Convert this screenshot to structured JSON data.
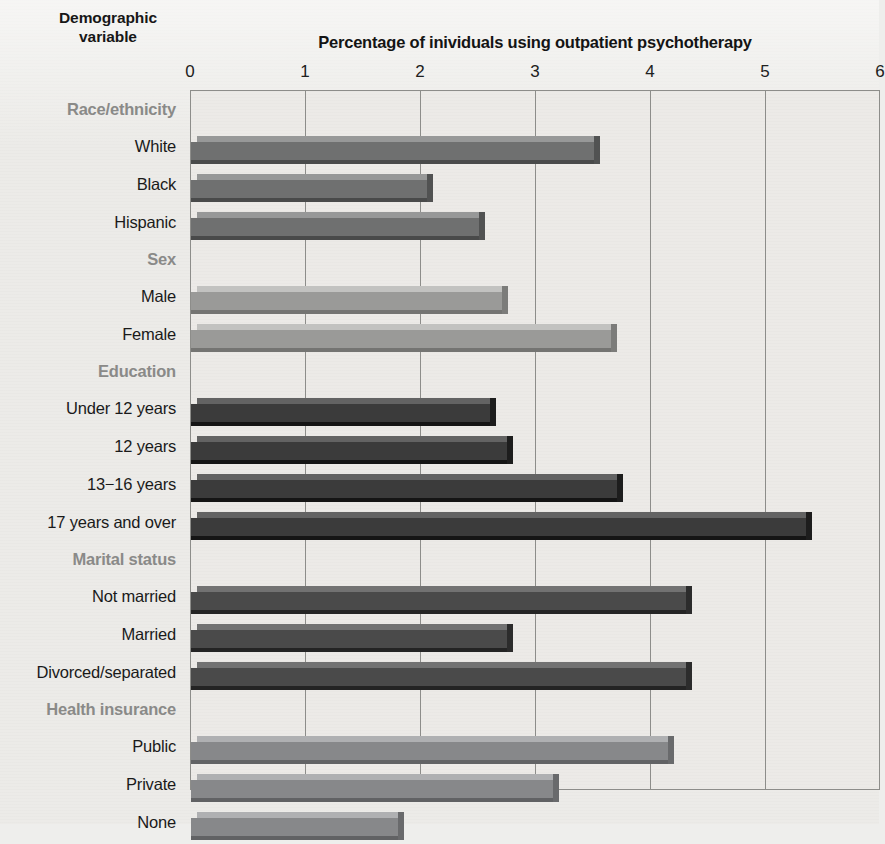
{
  "yaxis_title": {
    "line1": "Demographic",
    "line2": "variable"
  },
  "chart_data": {
    "type": "bar",
    "orientation": "horizontal",
    "title": "Percentage of inividuals using outpatient psychotherapy",
    "xlabel": "Percentage of inividuals using outpatient psychotherapy",
    "ylabel": "Demographic variable",
    "xlim": [
      0,
      6
    ],
    "xticks": [
      0,
      1,
      2,
      3,
      4,
      5,
      6
    ],
    "xtick_labels": [
      "0",
      "1",
      "2",
      "3",
      "4",
      "5",
      "6"
    ],
    "grid": true,
    "legend": "none",
    "groups": [
      {
        "name": "Race/ethnicity",
        "color": "#6f7070",
        "categories": [
          "White",
          "Black",
          "Hispanic"
        ],
        "values": [
          3.5,
          2.05,
          2.5
        ]
      },
      {
        "name": "Sex",
        "color": "#9a9a98",
        "categories": [
          "Male",
          "Female"
        ],
        "values": [
          2.7,
          3.65
        ]
      },
      {
        "name": "Education",
        "color": "#3b3b3b",
        "categories": [
          "Under 12 years",
          "12 years",
          "13−16 years",
          "17 years and over"
        ],
        "values": [
          2.6,
          2.75,
          3.7,
          5.35
        ]
      },
      {
        "name": "Marital status",
        "color": "#4a4a4a",
        "categories": [
          "Not married",
          "Married",
          "Divorced/separated"
        ],
        "values": [
          4.3,
          2.75,
          4.3
        ]
      },
      {
        "name": "Health insurance",
        "color": "#87888a",
        "categories": [
          "Public",
          "Private",
          "None"
        ],
        "values": [
          4.15,
          3.15,
          1.8
        ]
      }
    ]
  }
}
